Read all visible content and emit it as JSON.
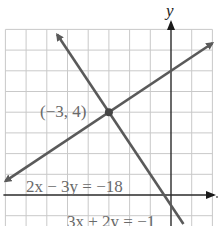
{
  "chart_data": {
    "type": "line",
    "title": "",
    "xlabel": "x",
    "ylabel": "y",
    "xlim": [
      -8,
      2
    ],
    "ylim": [
      -1,
      8
    ],
    "grid": true,
    "grid_step": 1,
    "series": [
      {
        "name": "2x - 3y = -18",
        "label": "2x − 3y = −18",
        "equation": {
          "a": 2,
          "b": -3,
          "c": -18
        },
        "x": [
          -8,
          2
        ],
        "y": [
          0.667,
          7.333
        ],
        "arrows": "both"
      },
      {
        "name": "3x + 2y = -1",
        "label": "3x + 2y = −1",
        "equation": {
          "a": 3,
          "b": 2,
          "c": -1
        },
        "x": [
          -5.5,
          0.6
        ],
        "y": [
          7.75,
          -1.4
        ],
        "arrows": "top"
      }
    ],
    "annotations": [
      {
        "text": "(−3, 4)",
        "x": -3,
        "y": 4,
        "type": "intersection-point"
      }
    ],
    "colors": {
      "line": "#5a5a5a",
      "grid": "#c9c9c9",
      "axis": "#2a2a2a",
      "text": "#6a6a6a"
    }
  }
}
